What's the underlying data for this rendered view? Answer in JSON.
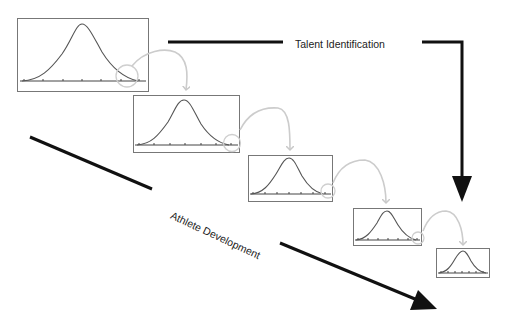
{
  "diagram": {
    "labels": {
      "talent_identification": "Talent Identification",
      "athlete_development": "Athlete Development"
    },
    "stages": [
      {
        "id": 1,
        "shape": "normal-distribution-curve",
        "box": {
          "x": 17,
          "y": 18,
          "w": 132,
          "h": 74
        }
      },
      {
        "id": 2,
        "shape": "normal-distribution-curve",
        "box": {
          "x": 133,
          "y": 95,
          "w": 107,
          "h": 58
        }
      },
      {
        "id": 3,
        "shape": "normal-distribution-curve",
        "box": {
          "x": 248,
          "y": 155,
          "w": 85,
          "h": 47
        }
      },
      {
        "id": 4,
        "shape": "normal-distribution-curve",
        "box": {
          "x": 353,
          "y": 208,
          "w": 69,
          "h": 38
        }
      },
      {
        "id": 5,
        "shape": "normal-distribution-curve",
        "box": {
          "x": 436,
          "y": 248,
          "w": 54,
          "h": 30
        }
      }
    ],
    "connectors": "right-tail circled and passed to next stage (light gray curved arrows)",
    "colors": {
      "arrow": "#111111",
      "box_border": "#777777",
      "curve": "#555555",
      "connector": "#cccccc",
      "text": "#222222"
    }
  }
}
